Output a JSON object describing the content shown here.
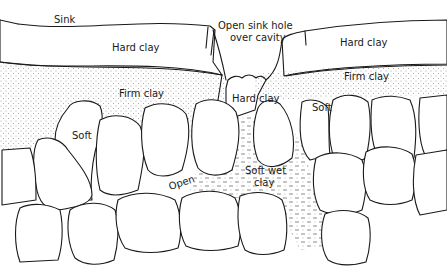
{
  "diagram": {
    "type": "geological cross-section",
    "labels": {
      "sink": "Sink",
      "open_sink_hole_line1": "Open sink hole",
      "open_sink_hole_line2": "over cavity",
      "hard_clay_left": "Hard clay",
      "hard_clay_right": "Hard clay",
      "hard_clay_center": "Hard clay",
      "firm_clay_left": "Firm clay",
      "firm_clay_right": "Firm clay",
      "soft_left": "Soft",
      "soft_right": "Soft",
      "open": "Open",
      "soft_wet_clay_line1": "Soft wet",
      "soft_wet_clay_line2": "clay"
    },
    "layers": [
      {
        "name": "Hard clay",
        "pattern": "coarse-dots"
      },
      {
        "name": "Firm clay",
        "pattern": "fine-dots"
      },
      {
        "name": "Soft wet clay",
        "pattern": "dashes-and-dots"
      },
      {
        "name": "Bedrock blocks",
        "pattern": "blank"
      }
    ],
    "colors": {
      "ink": "#1a1a1a",
      "paper": "#ffffff"
    }
  }
}
